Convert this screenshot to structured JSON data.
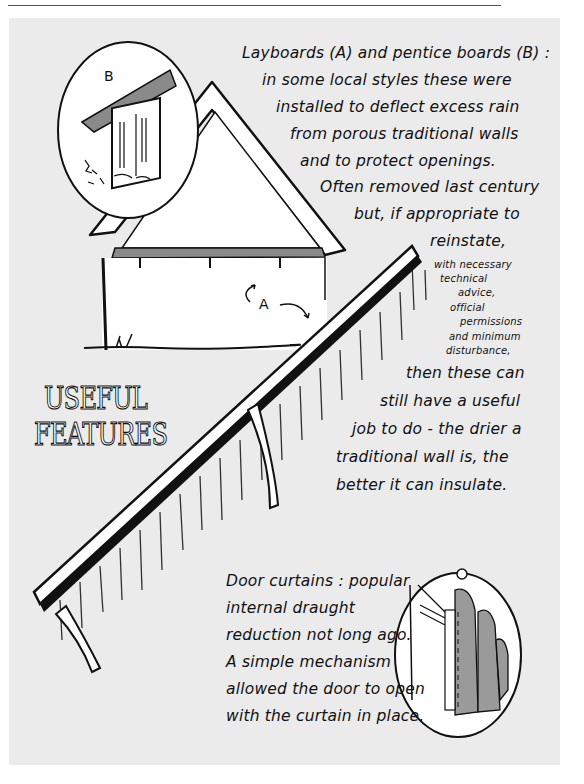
{
  "page": {
    "title_lines": [
      "USEFUL",
      "FEATURES"
    ]
  },
  "layboards_note": {
    "lines": [
      "Layboards (A) and pentice boards (B) :",
      "in some local styles these were",
      "installed to deflect excess rain",
      "from porous traditional walls",
      "and to protect openings.",
      "Often removed last century",
      "but, if appropriate to",
      "reinstate,"
    ],
    "small_lines": [
      "with necessary",
      "technical",
      "advice,",
      "official",
      "permissions",
      "and minimum",
      "disturbance,"
    ],
    "closing_lines": [
      "then these can",
      "still have a useful",
      "job to do - the drier a",
      "traditional wall is, the",
      "better it can insulate."
    ]
  },
  "door_curtains_note": {
    "lines": [
      "Door curtains : popular",
      "internal draught",
      "reduction not long ago.",
      "A simple mechanism",
      "allowed the door to open",
      "with the curtain in place."
    ]
  },
  "labels": {
    "a": "A",
    "b": "B"
  },
  "colors": {
    "panel": "#ebebeb",
    "ink": "#111111",
    "board_grey": "#8a8a8a",
    "curtain_grey": "#9a9a9a"
  }
}
